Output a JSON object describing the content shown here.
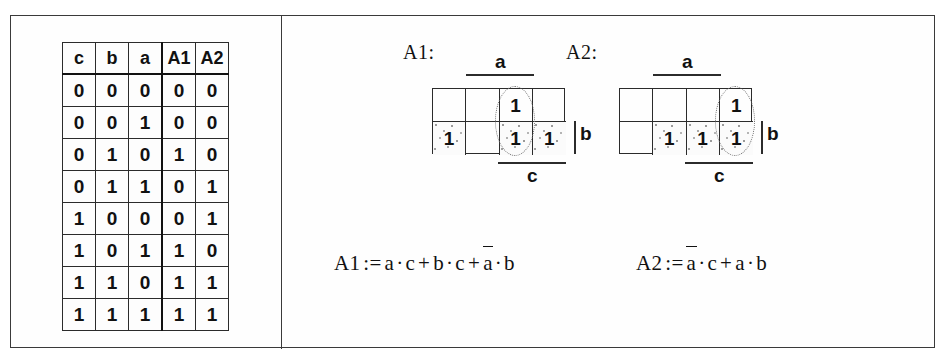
{
  "figure": {
    "type": "logic-figure"
  },
  "truth_table": {
    "name": "truth-table",
    "headers": [
      "c",
      "b",
      "a",
      "A1",
      "A2"
    ],
    "rows": [
      [
        "0",
        "0",
        "0",
        "0",
        "0"
      ],
      [
        "0",
        "0",
        "1",
        "0",
        "0"
      ],
      [
        "0",
        "1",
        "0",
        "1",
        "0"
      ],
      [
        "0",
        "1",
        "1",
        "0",
        "1"
      ],
      [
        "1",
        "0",
        "0",
        "0",
        "1"
      ],
      [
        "1",
        "0",
        "1",
        "1",
        "0"
      ],
      [
        "1",
        "1",
        "0",
        "1",
        "1"
      ],
      [
        "1",
        "1",
        "1",
        "1",
        "1"
      ]
    ]
  },
  "kmaps": [
    {
      "id": "A1",
      "label": "A1:",
      "top_var": "a",
      "bottom_var": "c",
      "right_var": "b",
      "cells": [
        [
          "",
          "",
          "1",
          ""
        ],
        [
          "1",
          "",
          "1",
          "1"
        ]
      ],
      "shaded": [
        [
          false,
          false,
          false,
          false
        ],
        [
          true,
          false,
          true,
          true
        ]
      ],
      "group_col": 2
    },
    {
      "id": "A2",
      "label": "A2:",
      "top_var": "a",
      "bottom_var": "c",
      "right_var": "b",
      "cells": [
        [
          "",
          "",
          "",
          "1"
        ],
        [
          "",
          "1",
          "1",
          "1"
        ]
      ],
      "shaded": [
        [
          false,
          false,
          false,
          false
        ],
        [
          false,
          true,
          true,
          true
        ]
      ],
      "group_col": 3
    }
  ],
  "formulas": [
    {
      "id": "A1",
      "lhs": "A1",
      "assign": ":=",
      "terms": [
        {
          "factors": [
            {
              "v": "a",
              "bar": false
            },
            {
              "v": "c",
              "bar": false
            }
          ]
        },
        {
          "factors": [
            {
              "v": "b",
              "bar": false
            },
            {
              "v": "c",
              "bar": false
            }
          ]
        },
        {
          "factors": [
            {
              "v": "a",
              "bar": true
            },
            {
              "v": "b",
              "bar": false
            }
          ]
        }
      ],
      "plain": "A1 := a · c + b · c + ā · b"
    },
    {
      "id": "A2",
      "lhs": "A2",
      "assign": ":=",
      "terms": [
        {
          "factors": [
            {
              "v": "a",
              "bar": true
            },
            {
              "v": "c",
              "bar": false
            }
          ]
        },
        {
          "factors": [
            {
              "v": "a",
              "bar": false
            },
            {
              "v": "b",
              "bar": false
            }
          ]
        }
      ],
      "plain": "A2 := ā · c + a · b"
    }
  ],
  "symbols": {
    "plus": "+",
    "dot": "·",
    "assign": ":="
  },
  "colors": {
    "ink": "#111111",
    "rule": "#2b2b2b",
    "frame": "#3a3a3a",
    "shade_dot": "#9a9a9a",
    "paper": "#ffffff"
  }
}
